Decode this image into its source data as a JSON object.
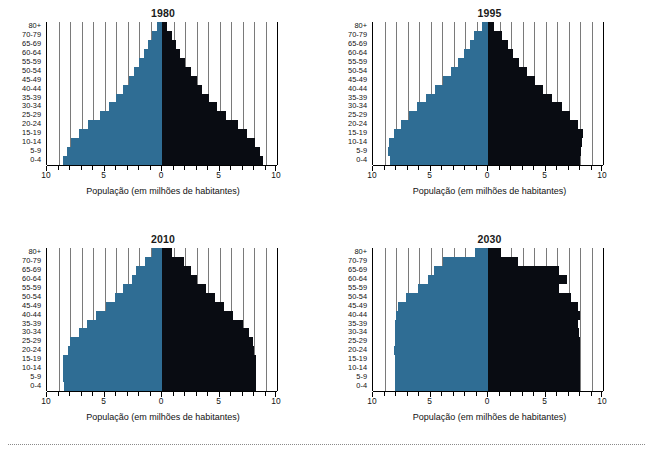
{
  "figure": {
    "panels": [
      "1980",
      "1995",
      "2010",
      "2030"
    ],
    "xlabel": "População (em milhões de habitantes)",
    "colors": {
      "male": "#2f6d94",
      "female": "#090c12",
      "grid": "#7a7a7a",
      "axis": "#000000"
    }
  },
  "axis": {
    "ticks_major": [
      "10",
      "5",
      "0",
      "5",
      "10"
    ],
    "tick_values": [
      -10,
      -5,
      0,
      5,
      10
    ],
    "minor_step": 1,
    "xmin": -10,
    "xmax": 10
  },
  "age_groups": [
    "80+",
    "70-79",
    "65-69",
    "60-64",
    "55-59",
    "50-54",
    "45-49",
    "40-44",
    "35-39",
    "30-34",
    "25-29",
    "20-24",
    "15-19",
    "10-14",
    "5-9",
    "0-4"
  ],
  "chart_data": [
    {
      "type": "bar",
      "title": "1980",
      "subtype": "population-pyramid",
      "xlabel": "População (em milhões de habitantes)",
      "ylabel": "",
      "categories": [
        "80+",
        "70-79",
        "65-69",
        "60-64",
        "55-59",
        "50-54",
        "45-49",
        "40-44",
        "35-39",
        "30-34",
        "25-29",
        "20-24",
        "15-19",
        "10-14",
        "5-9",
        "0-4"
      ],
      "xlim": [
        -10,
        10
      ],
      "grid": true,
      "legend": "none",
      "series": [
        {
          "name": "left",
          "color": "#2f6d94",
          "values": [
            0.4,
            0.9,
            1.2,
            1.6,
            2.0,
            2.4,
            2.9,
            3.4,
            4.0,
            4.6,
            5.4,
            6.4,
            7.2,
            7.9,
            8.3,
            8.6
          ]
        },
        {
          "name": "right",
          "color": "#090c12",
          "values": [
            0.4,
            0.9,
            1.2,
            1.6,
            2.0,
            2.5,
            3.0,
            3.5,
            4.1,
            4.8,
            5.6,
            6.6,
            7.4,
            8.1,
            8.5,
            8.8
          ]
        }
      ]
    },
    {
      "type": "bar",
      "title": "1995",
      "subtype": "population-pyramid",
      "xlabel": "População (em milhões de habitantes)",
      "ylabel": "",
      "categories": [
        "80+",
        "70-79",
        "65-69",
        "60-64",
        "55-59",
        "50-54",
        "45-49",
        "40-44",
        "35-39",
        "30-34",
        "25-29",
        "20-24",
        "15-19",
        "10-14",
        "5-9",
        "0-4"
      ],
      "xlim": [
        -10,
        10
      ],
      "grid": true,
      "legend": "none",
      "series": [
        {
          "name": "left",
          "color": "#2f6d94",
          "values": [
            0.5,
            1.2,
            1.6,
            2.1,
            2.6,
            3.2,
            3.9,
            4.6,
            5.4,
            6.2,
            6.9,
            7.6,
            8.2,
            8.6,
            8.7,
            8.5
          ]
        },
        {
          "name": "right",
          "color": "#090c12",
          "values": [
            0.5,
            1.2,
            1.7,
            2.2,
            2.7,
            3.4,
            4.1,
            4.8,
            5.6,
            6.4,
            7.1,
            7.8,
            8.3,
            8.2,
            8.1,
            8.0
          ]
        }
      ]
    },
    {
      "type": "bar",
      "title": "2010",
      "subtype": "population-pyramid",
      "xlabel": "População (em milhões de habitantes)",
      "ylabel": "",
      "categories": [
        "80+",
        "70-79",
        "65-69",
        "60-64",
        "55-59",
        "50-54",
        "45-49",
        "40-44",
        "35-39",
        "30-34",
        "25-29",
        "20-24",
        "15-19",
        "10-14",
        "5-9",
        "0-4"
      ],
      "xlim": [
        -10,
        10
      ],
      "grid": true,
      "legend": "none",
      "series": [
        {
          "name": "left",
          "color": "#2f6d94",
          "values": [
            0.9,
            1.5,
            2.3,
            2.6,
            3.4,
            4.1,
            4.9,
            5.7,
            6.5,
            7.2,
            8.0,
            8.2,
            8.6,
            8.6,
            8.6,
            8.5
          ]
        },
        {
          "name": "right",
          "color": "#090c12",
          "values": [
            0.9,
            1.9,
            2.5,
            3.0,
            3.8,
            4.6,
            5.4,
            6.2,
            7.0,
            7.6,
            7.9,
            8.0,
            8.2,
            8.2,
            8.2,
            8.2
          ]
        }
      ]
    },
    {
      "type": "bar",
      "title": "2030",
      "subtype": "population-pyramid",
      "xlabel": "População (em milhões de habitantes)",
      "ylabel": "",
      "categories": [
        "80+",
        "70-79",
        "65-69",
        "60-64",
        "55-59",
        "50-54",
        "45-49",
        "40-44",
        "35-39",
        "30-34",
        "25-29",
        "20-24",
        "15-19",
        "10-14",
        "5-9",
        "0-4"
      ],
      "xlim": [
        -10,
        10
      ],
      "grid": true,
      "legend": "none",
      "series": [
        {
          "name": "left",
          "color": "#2f6d94",
          "values": [
            1.1,
            3.9,
            4.7,
            5.2,
            6.1,
            7.1,
            7.8,
            8.0,
            8.1,
            8.1,
            8.1,
            8.2,
            8.1,
            8.1,
            8.1,
            8.1
          ]
        },
        {
          "name": "right",
          "color": "#090c12",
          "values": [
            1.1,
            2.6,
            6.2,
            6.9,
            6.2,
            7.2,
            7.8,
            8.0,
            7.8,
            7.9,
            8.0,
            8.0,
            8.0,
            8.0,
            8.0,
            8.0
          ]
        }
      ]
    }
  ]
}
